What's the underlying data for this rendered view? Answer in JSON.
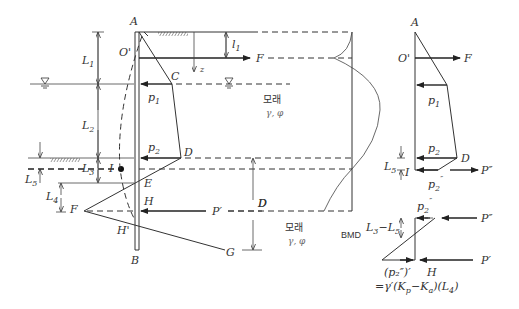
{
  "figure": {
    "type": "cantilever sheet pile wall with anchor - pressure and bending moment diagrams",
    "main_diagram": {
      "points": [
        "A",
        "O'",
        "C",
        "D",
        "I",
        "E",
        "H",
        "H'",
        "F",
        "G",
        "B"
      ],
      "labels": {
        "A": "A",
        "O": "O'",
        "C": "C",
        "D": "D",
        "I": "I",
        "E": "E",
        "H": "H",
        "Hp": "H'",
        "F": "F",
        "G": "G",
        "B": "B"
      },
      "dimensions": {
        "L1": "L",
        "L1_sub": "1",
        "L2": "L",
        "L2_sub": "2",
        "L3": "L",
        "L3_sub": "3",
        "L4": "L",
        "L4_sub": "4",
        "L5": "L",
        "L5_sub": "5",
        "l1": "l",
        "l1_sub": "1",
        "D": "D"
      },
      "forces": {
        "F": "F",
        "Pprime": "P′",
        "z": "z"
      },
      "pressures": {
        "p1": "p",
        "p1_sub": "1",
        "p2": "p",
        "p2_sub": "2"
      },
      "soil_upper": {
        "name": "모래",
        "props": "γ, φ"
      },
      "soil_lower": {
        "name": "모래",
        "props": "γ, φ"
      },
      "bmd_label": "BMD"
    },
    "upper_free_body": {
      "labels": {
        "A": "A",
        "O": "O'",
        "F": "F",
        "p1": "p",
        "p1_sub": "1",
        "p2": "p",
        "p2_sub": "2",
        "D": "D",
        "L5": "L",
        "L5_sub": "5",
        "I": "I",
        "P2pp": "P″",
        "p2pp": "p",
        "p2pp_sub": "2",
        "p2pp_sup": "″"
      }
    },
    "lower_free_body": {
      "labels": {
        "p2pp": "p",
        "p2pp_sub": "2",
        "p2pp_sup": "″",
        "Ppp": "P″",
        "L3mL5": "L",
        "L3mL5_sub1": "3",
        "L3mL5_minus": "−",
        "L3mL5_L": "L",
        "L3mL5_sub2": "5",
        "Pp": "P′",
        "H": "H",
        "formula_line1": "(p₂″)′",
        "formula_line2": "=γ′(K",
        "formula_p": "p",
        "formula_mid": "−K",
        "formula_a": "a",
        "formula_end": ")(L",
        "formula_4": "4",
        "formula_close": ")"
      }
    }
  }
}
